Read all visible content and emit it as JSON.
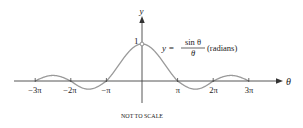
{
  "chart_data": {
    "type": "line",
    "title": "",
    "function_label": {
      "lhs": "y =",
      "numerator": "sin θ",
      "denominator": "θ",
      "note": "(radians)"
    },
    "xlabel": "θ",
    "ylabel": "y",
    "y_tick_labels": [
      "1"
    ],
    "x_tick_labels": [
      "−3π",
      "−2π",
      "−π",
      "π",
      "2π",
      "3π"
    ],
    "x_tick_values": [
      -9.4248,
      -6.2832,
      -3.1416,
      3.1416,
      6.2832,
      9.4248
    ],
    "xlim": [
      -10.5,
      12.3
    ],
    "ylim": [
      -0.6,
      1.6
    ],
    "grid": false,
    "legend": "none",
    "annotation": "NOT TO SCALE",
    "open_point": {
      "x": 0,
      "y": 1
    },
    "series": [
      {
        "name": "y = sin θ / θ",
        "x": [
          -9.4248,
          -7.854,
          -6.2832,
          -4.7124,
          -3.1416,
          -1.5708,
          0,
          1.5708,
          3.1416,
          4.7124,
          6.2832,
          7.854,
          9.4248
        ],
        "values": [
          0,
          0.127,
          0,
          -0.212,
          0,
          0.637,
          1,
          0.637,
          0,
          -0.212,
          0,
          0.127,
          0
        ]
      }
    ]
  },
  "colors": {
    "axis": "#444444",
    "curve": "#9a9a9a",
    "text": "#222222"
  },
  "caption": "NOT TO SCALE"
}
